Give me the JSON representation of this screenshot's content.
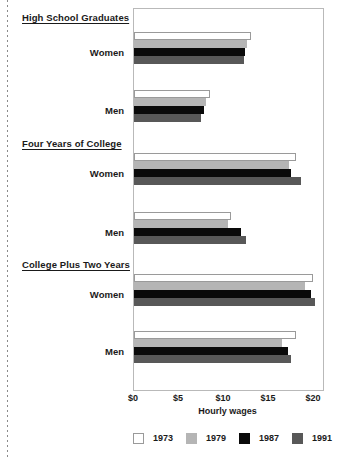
{
  "chart_data": {
    "type": "bar",
    "orientation": "horizontal",
    "title": "",
    "xlabel": "Hourly wages",
    "ylabel": "",
    "xlim": [
      0,
      21
    ],
    "xticks": [
      0,
      5,
      10,
      15,
      20
    ],
    "xtick_labels": [
      "$0",
      "$5",
      "$10",
      "$15",
      "$20"
    ],
    "grid": false,
    "legend_position": "bottom",
    "legend_entries": [
      "1973",
      "1979",
      "1987",
      "1991"
    ],
    "series": [
      {
        "name": "1973",
        "color": "#ffffff",
        "values": [
          13.0,
          8.4,
          18.0,
          10.8,
          19.9,
          18.0
        ]
      },
      {
        "name": "1979",
        "color": "#b5b5b5",
        "values": [
          12.6,
          8.0,
          17.2,
          10.4,
          19.0,
          16.4
        ]
      },
      {
        "name": "1987",
        "color": "#0a0a0a",
        "values": [
          12.3,
          7.8,
          17.4,
          11.9,
          19.7,
          17.1
        ]
      },
      {
        "name": "1991",
        "color": "#585858",
        "values": [
          12.2,
          7.4,
          18.6,
          12.4,
          20.1,
          17.4
        ]
      }
    ],
    "categories": [
      "High School Graduates - Women",
      "High School Graduates - Men",
      "Four Years of College - Women",
      "Four Years of College - Men",
      "College Plus Two Years - Women",
      "College Plus Two Years - Men"
    ],
    "groups": [
      {
        "heading": "High School Graduates",
        "rows": [
          {
            "label": "Women",
            "bars": [
              {
                "year": "1973",
                "value": 13.0
              },
              {
                "year": "1979",
                "value": 12.6
              },
              {
                "year": "1987",
                "value": 12.3
              },
              {
                "year": "1991",
                "value": 12.2
              }
            ]
          },
          {
            "label": "Men",
            "bars": [
              {
                "year": "1973",
                "value": 8.4
              },
              {
                "year": "1979",
                "value": 8.0
              },
              {
                "year": "1987",
                "value": 7.8
              },
              {
                "year": "1991",
                "value": 7.4
              }
            ]
          }
        ]
      },
      {
        "heading": "Four Years of College",
        "rows": [
          {
            "label": "Women",
            "bars": [
              {
                "year": "1973",
                "value": 18.0
              },
              {
                "year": "1979",
                "value": 17.2
              },
              {
                "year": "1987",
                "value": 17.4
              },
              {
                "year": "1991",
                "value": 18.6
              }
            ]
          },
          {
            "label": "Men",
            "bars": [
              {
                "year": "1973",
                "value": 10.8
              },
              {
                "year": "1979",
                "value": 10.4
              },
              {
                "year": "1987",
                "value": 11.9
              },
              {
                "year": "1991",
                "value": 12.4
              }
            ]
          }
        ]
      },
      {
        "heading": "College Plus Two Years",
        "rows": [
          {
            "label": "Women",
            "bars": [
              {
                "year": "1973",
                "value": 19.9
              },
              {
                "year": "1979",
                "value": 19.0
              },
              {
                "year": "1987",
                "value": 19.7
              },
              {
                "year": "1991",
                "value": 20.1
              }
            ]
          },
          {
            "label": "Men",
            "bars": [
              {
                "year": "1973",
                "value": 18.0
              },
              {
                "year": "1979",
                "value": 16.4
              },
              {
                "year": "1987",
                "value": 17.1
              },
              {
                "year": "1991",
                "value": 17.4
              }
            ]
          }
        ]
      }
    ]
  },
  "axis": {
    "x_title": "Hourly wages",
    "tick_labels": [
      "$0",
      "$5",
      "$10",
      "$15",
      "$20"
    ]
  },
  "legend": {
    "items": [
      {
        "label": "1973",
        "swatch": "legend-swatch-1973"
      },
      {
        "label": "1979",
        "swatch": "legend-swatch-1979"
      },
      {
        "label": "1987",
        "swatch": "legend-swatch-1987"
      },
      {
        "label": "1991",
        "swatch": "legend-swatch-1991"
      }
    ]
  },
  "labels": {
    "group_1_heading": "High School Graduates",
    "group_1_row_1": "Women",
    "group_1_row_2": "Men",
    "group_2_heading": "Four Years of College",
    "group_2_row_1": "Women",
    "group_2_row_2": "Men",
    "group_3_heading": "College Plus Two Years",
    "group_3_row_1": "Women",
    "group_3_row_2": "Men"
  },
  "colors": {
    "y1973": "#ffffff",
    "y1979": "#b5b5b5",
    "y1987": "#0a0a0a",
    "y1991": "#585858",
    "frame": "#b9b9b9",
    "text": "#1a1a1a"
  }
}
